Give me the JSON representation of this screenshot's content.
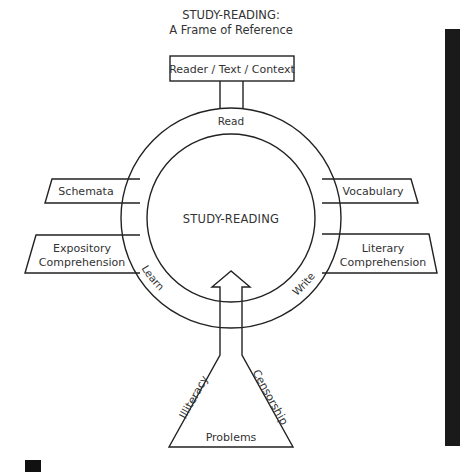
{
  "title": {
    "line1": "STUDY-READING:",
    "line2": "A Frame of Reference"
  },
  "top_box": {
    "label": "Reader / Text / Context"
  },
  "center": {
    "label": "STUDY-READING"
  },
  "ring_labels": {
    "top": "Read",
    "left": "Learn",
    "right": "Write"
  },
  "left_boxes": [
    {
      "lines": [
        "Schemata"
      ]
    },
    {
      "lines": [
        "Expository",
        "Comprehension"
      ]
    }
  ],
  "right_boxes": [
    {
      "lines": [
        "Vocabulary"
      ]
    },
    {
      "lines": [
        "Literary",
        "Comprehension"
      ]
    }
  ],
  "flask": {
    "left_label": "Illiteracy",
    "right_label": "Censorship",
    "base_label": "Problems"
  },
  "colors": {
    "line": "#222222",
    "text": "#333333",
    "side_bar": "#1a1a1a"
  }
}
